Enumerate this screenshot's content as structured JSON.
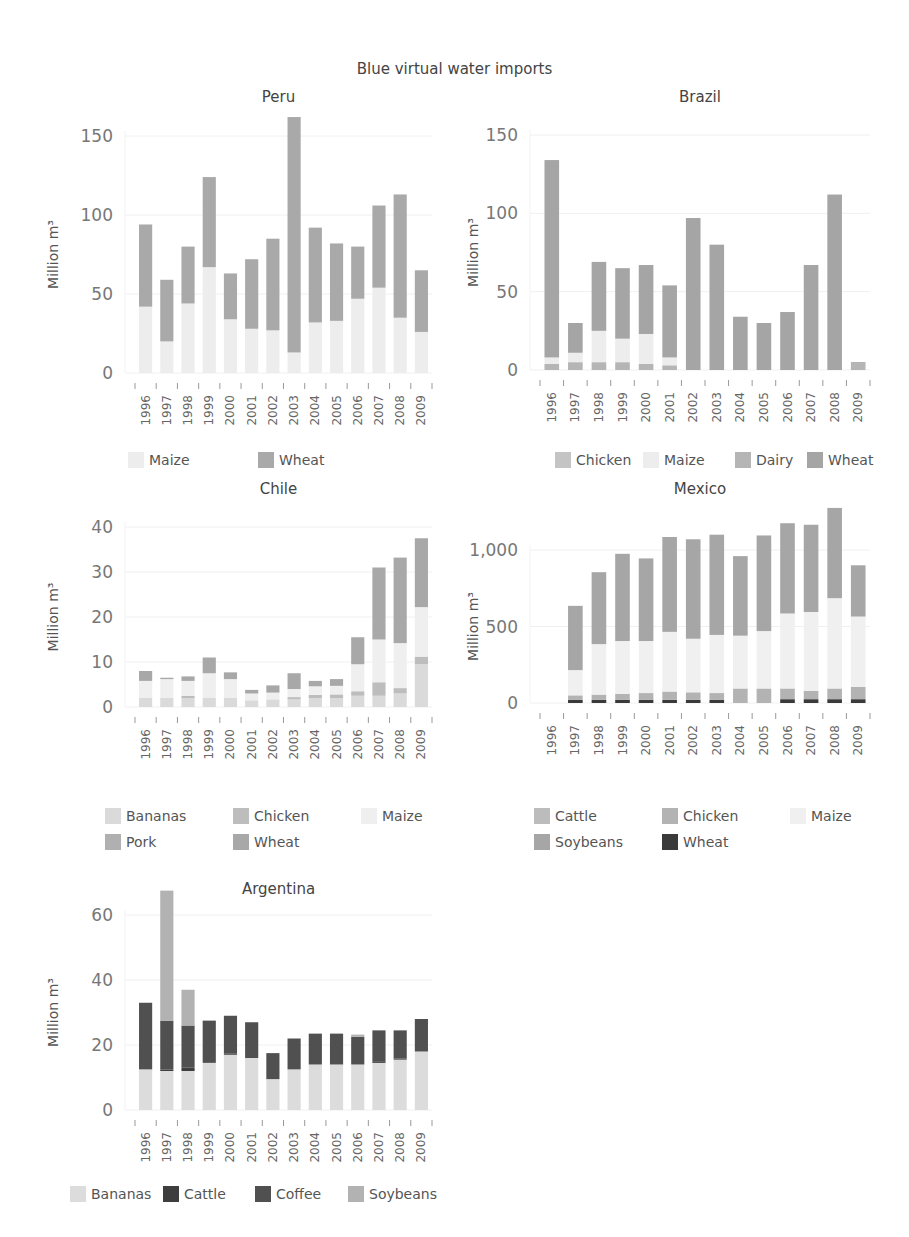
{
  "title": "Blue virtual water imports",
  "chart_data": [
    {
      "type": "bar",
      "stacked": true,
      "title": "Peru",
      "xlabel": "",
      "ylabel": "Million m³",
      "ylim": [
        0,
        150
      ],
      "yticks": [
        0,
        50,
        100,
        150
      ],
      "ytick_labels": [
        "0",
        "50",
        "100",
        "150"
      ],
      "grid": true,
      "legend_position": "bottom",
      "categories": [
        "1996",
        "1997",
        "1998",
        "1999",
        "2000",
        "2001",
        "2002",
        "2003",
        "2004",
        "2005",
        "2006",
        "2007",
        "2008",
        "2009"
      ],
      "series": [
        {
          "name": "Maize",
          "color": "#ededed",
          "values": [
            42,
            20,
            44,
            67,
            34,
            28,
            27,
            13,
            32,
            33,
            47,
            54,
            35,
            26
          ]
        },
        {
          "name": "Wheat",
          "color": "#a9a9a9",
          "values": [
            52,
            39,
            36,
            57,
            29,
            44,
            58,
            149,
            60,
            49,
            33,
            52,
            78,
            39
          ]
        }
      ]
    },
    {
      "type": "bar",
      "stacked": true,
      "title": "Brazil",
      "xlabel": "",
      "ylabel": "Million m³",
      "ylim": [
        0,
        150
      ],
      "yticks": [
        0,
        50,
        100,
        150
      ],
      "ytick_labels": [
        "0",
        "50",
        "100",
        "150"
      ],
      "grid": true,
      "legend_position": "bottom",
      "categories": [
        "1996",
        "1997",
        "1998",
        "1999",
        "2000",
        "2001",
        "2002",
        "2003",
        "2004",
        "2005",
        "2006",
        "2007",
        "2008",
        "2009"
      ],
      "series": [
        {
          "name": "Chicken",
          "color": "#c4c4c4",
          "values": [
            0,
            0,
            0,
            0,
            0,
            0,
            0,
            0,
            0,
            0,
            0,
            0,
            0,
            0
          ]
        },
        {
          "name": "Dairy",
          "color": "#b5b5b5",
          "values": [
            4,
            5,
            5,
            5,
            4,
            3,
            0,
            0,
            0,
            0,
            0,
            0,
            0,
            4
          ]
        },
        {
          "name": "Maize",
          "color": "#ededed",
          "values": [
            4,
            6,
            20,
            15,
            19,
            5,
            0,
            0,
            0,
            0,
            0,
            0,
            0,
            0
          ]
        },
        {
          "name": "Wheat",
          "color": "#a5a5a5",
          "values": [
            126,
            19,
            44,
            45,
            44,
            46,
            97,
            80,
            34,
            30,
            37,
            67,
            112,
            1
          ]
        }
      ]
    },
    {
      "type": "bar",
      "stacked": true,
      "title": "Chile",
      "xlabel": "",
      "ylabel": "Million m³",
      "ylim": [
        0,
        40
      ],
      "yticks": [
        0,
        10,
        20,
        30,
        40
      ],
      "ytick_labels": [
        "0",
        "10",
        "20",
        "30",
        "40"
      ],
      "grid": true,
      "legend_position": "bottom",
      "categories": [
        "1996",
        "1997",
        "1998",
        "1999",
        "2000",
        "2001",
        "2002",
        "2003",
        "2004",
        "2005",
        "2006",
        "2007",
        "2008",
        "2009"
      ],
      "series": [
        {
          "name": "Bananas",
          "color": "#dadada",
          "values": [
            2.0,
            2.0,
            2.0,
            2.0,
            2.0,
            1.5,
            1.7,
            1.7,
            2.0,
            2.0,
            2.5,
            2.5,
            3.0,
            9.5
          ]
        },
        {
          "name": "Chicken",
          "color": "#bdbdbd",
          "values": [
            0,
            0,
            0.5,
            0,
            0,
            0,
            0,
            0.5,
            0.7,
            0.8,
            1.0,
            3.0,
            1.2,
            1.7
          ]
        },
        {
          "name": "Pork",
          "color": "#b0b0b0",
          "values": [
            0,
            0,
            0,
            0,
            0,
            0,
            0,
            0,
            0,
            0,
            0,
            0,
            0,
            0
          ]
        },
        {
          "name": "Maize",
          "color": "#efefef",
          "values": [
            3.8,
            4.2,
            3.3,
            5.5,
            4.2,
            1.5,
            1.5,
            1.8,
            1.9,
            1.9,
            6.0,
            9.5,
            10.0,
            11.0
          ]
        },
        {
          "name": "Wheat",
          "color": "#a8a8a8",
          "values": [
            2.2,
            0.3,
            1.0,
            3.5,
            1.5,
            0.8,
            1.6,
            3.5,
            1.2,
            1.5,
            6.0,
            16.0,
            19.0,
            15.3
          ]
        }
      ]
    },
    {
      "type": "bar",
      "stacked": true,
      "title": "Mexico",
      "xlabel": "",
      "ylabel": "Million m³",
      "ylim": [
        0,
        1000
      ],
      "yticks": [
        0,
        500,
        1000
      ],
      "ytick_labels": [
        "0",
        "500",
        "1,000"
      ],
      "grid": true,
      "legend_position": "bottom",
      "categories": [
        "1996",
        "1997",
        "1998",
        "1999",
        "2000",
        "2001",
        "2002",
        "2003",
        "2004",
        "2005",
        "2006",
        "2007",
        "2008",
        "2009"
      ],
      "series": [
        {
          "name": "Wheat",
          "color": "#3a3a3a",
          "values": [
            0,
            20,
            20,
            20,
            20,
            20,
            20,
            20,
            0,
            0,
            25,
            25,
            25,
            25
          ]
        },
        {
          "name": "Cattle",
          "color": "#bcbcbc",
          "values": [
            0,
            0,
            0,
            0,
            0,
            0,
            0,
            0,
            0,
            0,
            0,
            0,
            0,
            0
          ]
        },
        {
          "name": "Chicken",
          "color": "#b3b3b3",
          "values": [
            0,
            30,
            35,
            40,
            45,
            55,
            50,
            45,
            95,
            95,
            70,
            55,
            70,
            80
          ]
        },
        {
          "name": "Maize",
          "color": "#f0f0f0",
          "values": [
            0,
            165,
            330,
            345,
            340,
            390,
            350,
            380,
            345,
            375,
            490,
            515,
            590,
            460
          ]
        },
        {
          "name": "Soybeans",
          "color": "#a6a6a6",
          "values": [
            0,
            420,
            470,
            570,
            540,
            620,
            650,
            655,
            520,
            625,
            590,
            570,
            590,
            335
          ]
        }
      ]
    },
    {
      "type": "bar",
      "stacked": true,
      "title": "Argentina",
      "xlabel": "",
      "ylabel": "Million m³",
      "ylim": [
        0,
        60
      ],
      "yticks": [
        0,
        20,
        40,
        60
      ],
      "ytick_labels": [
        "0",
        "20",
        "40",
        "60"
      ],
      "grid": true,
      "legend_position": "bottom",
      "categories": [
        "1996",
        "1997",
        "1998",
        "1999",
        "2000",
        "2001",
        "2002",
        "2003",
        "2004",
        "2005",
        "2006",
        "2007",
        "2008",
        "2009"
      ],
      "series": [
        {
          "name": "Bananas",
          "color": "#dcdcdc",
          "values": [
            12.5,
            12.0,
            12.0,
            14.5,
            17.0,
            16.0,
            9.5,
            12.5,
            14.0,
            14.0,
            14.0,
            14.5,
            15.5,
            18.0
          ]
        },
        {
          "name": "Cattle",
          "color": "#3e3e3e",
          "values": [
            0,
            0.5,
            1.0,
            0,
            0.3,
            0,
            0,
            0,
            0,
            0,
            0,
            0.5,
            0.3,
            0
          ]
        },
        {
          "name": "Coffee",
          "color": "#505050",
          "values": [
            20.5,
            15.0,
            13.0,
            13.0,
            11.7,
            11.0,
            8.0,
            9.5,
            9.5,
            9.5,
            8.5,
            9.5,
            8.7,
            10.0
          ]
        },
        {
          "name": "Soybeans",
          "color": "#b2b2b2",
          "values": [
            0,
            40.0,
            11.0,
            0,
            0,
            0,
            0,
            0,
            0,
            0,
            0.7,
            0,
            0,
            0
          ]
        }
      ]
    }
  ],
  "legends": {
    "peru": [
      "Maize",
      "Wheat"
    ],
    "brazil": [
      "Chicken",
      "Maize",
      "Dairy",
      "Wheat"
    ],
    "chile": [
      "Bananas",
      "Chicken",
      "Maize",
      "Pork",
      "Wheat"
    ],
    "mexico": [
      "Cattle",
      "Chicken",
      "Maize",
      "Soybeans",
      "Wheat"
    ],
    "argentina": [
      "Bananas",
      "Cattle",
      "Coffee",
      "Soybeans"
    ]
  },
  "legend_colors": {
    "peru": [
      "#ededed",
      "#a9a9a9"
    ],
    "brazil": [
      "#c4c4c4",
      "#ededed",
      "#b5b5b5",
      "#a5a5a5"
    ],
    "chile": [
      "#dadada",
      "#bdbdbd",
      "#efefef",
      "#b0b0b0",
      "#a8a8a8"
    ],
    "mexico": [
      "#bcbcbc",
      "#b3b3b3",
      "#f0f0f0",
      "#a6a6a6",
      "#3a3a3a"
    ],
    "argentina": [
      "#dcdcdc",
      "#3e3e3e",
      "#505050",
      "#b2b2b2"
    ]
  }
}
